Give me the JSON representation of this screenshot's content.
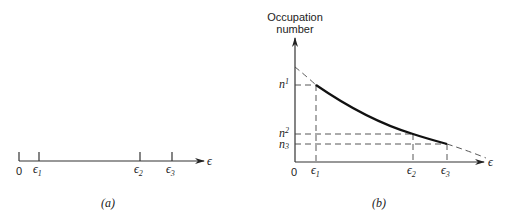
{
  "panel_a": {
    "caption": "(a)",
    "axis_label": "ϵ",
    "ticks": [
      {
        "label": "0"
      },
      {
        "label": "ϵ",
        "sub": "1"
      },
      {
        "label": "ϵ",
        "sub": "2"
      },
      {
        "label": "ϵ",
        "sub": "3"
      }
    ]
  },
  "panel_b": {
    "caption": "(b)",
    "y_label_line1": "Occupation",
    "y_label_line2": "number",
    "x_axis_label": "ϵ",
    "origin": "0",
    "x_ticks": [
      {
        "label": "ϵ",
        "sub": "1"
      },
      {
        "label": "ϵ",
        "sub": "2"
      },
      {
        "label": "ϵ",
        "sub": "3"
      }
    ],
    "y_ticks": [
      {
        "label": "n",
        "sub": "1"
      },
      {
        "label": "n",
        "sub": "2"
      },
      {
        "label": "n",
        "sub": "3"
      }
    ]
  }
}
